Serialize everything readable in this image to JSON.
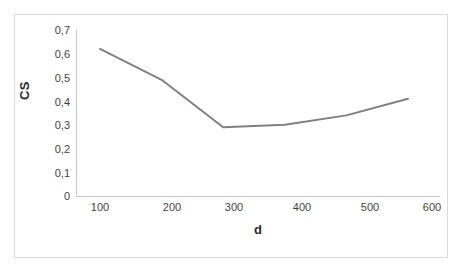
{
  "figure": {
    "background_color": "#ffffff",
    "frame_color": "#d9d9d9"
  },
  "axis": {
    "y_title": "CS",
    "x_title": "d",
    "axis_line_color": "#c6c6c6",
    "y_tick_labels": [
      "0,7",
      "0,6",
      "0,5",
      "0,4",
      "0,3",
      "0,2",
      "0,1",
      "0"
    ],
    "x_tick_labels": [
      "100",
      "200",
      "300",
      "400",
      "500",
      "600"
    ]
  },
  "chart_data": {
    "type": "line",
    "title": "",
    "subtitle": "",
    "xlabel": "d",
    "ylabel": "CS",
    "x": [
      100,
      200,
      300,
      400,
      500,
      600
    ],
    "categories": [
      "100",
      "200",
      "300",
      "400",
      "500",
      "600"
    ],
    "series": [
      {
        "name": "CS",
        "values": [
          0.62,
          0.49,
          0.29,
          0.3,
          0.34,
          0.41
        ],
        "color": "#808080",
        "line_width": 2,
        "markers": false
      }
    ],
    "xlim": [
      100,
      600
    ],
    "ylim": [
      0,
      0.7
    ],
    "y_ticks": [
      0,
      0.1,
      0.2,
      0.3,
      0.4,
      0.5,
      0.6,
      0.7
    ],
    "y_tick_labels": [
      "0",
      "0,1",
      "0,2",
      "0,3",
      "0,4",
      "0,5",
      "0,6",
      "0,7"
    ],
    "x_ticks": [
      100,
      200,
      300,
      400,
      500,
      600
    ],
    "x_tick_labels": [
      "100",
      "200",
      "300",
      "400",
      "500",
      "600"
    ],
    "decimal_separator": ",",
    "grid": false,
    "legend": false,
    "legend_position": "none"
  }
}
